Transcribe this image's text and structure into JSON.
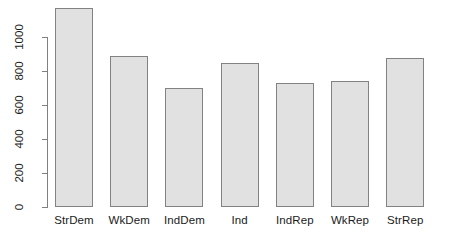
{
  "chart_data": {
    "type": "bar",
    "title": "",
    "subtitle": "",
    "xlabel": "",
    "ylabel": "",
    "categories": [
      "StrDem",
      "WkDem",
      "IndDem",
      "Ind",
      "IndRep",
      "WkRep",
      "StrRep"
    ],
    "values": [
      1170,
      890,
      700,
      845,
      730,
      740,
      875
    ],
    "ylim": [
      0,
      1170
    ],
    "y_ticks": [
      0,
      200,
      400,
      600,
      800,
      1000
    ],
    "y_tick_labels": [
      "0",
      "200",
      "400",
      "600",
      "800",
      "1000"
    ],
    "grid": false,
    "legend": false,
    "legend_position": "none",
    "bar_fill_color": "#e1e1e1",
    "bar_border_color": "#828282",
    "axis_color": "#808080",
    "text_color": "#1a1a1a",
    "background_color": "#ffffff",
    "y_axis_label_orientation": "rotated-90",
    "bars": [
      {
        "category": "StrDem",
        "value": 1170
      },
      {
        "category": "WkDem",
        "value": 890
      },
      {
        "category": "IndDem",
        "value": 700
      },
      {
        "category": "Ind",
        "value": 845
      },
      {
        "category": "IndRep",
        "value": 730
      },
      {
        "category": "WkRep",
        "value": 740
      },
      {
        "category": "StrRep",
        "value": 875
      }
    ]
  },
  "geometry": {
    "baseline_y": 207,
    "y_at_1000": 37,
    "bar_width": 38,
    "bar_pitch": 55.2,
    "first_bar_left": 55,
    "axis_x": 47,
    "axis_top_y": 37,
    "axis_bottom_y": 207
  }
}
